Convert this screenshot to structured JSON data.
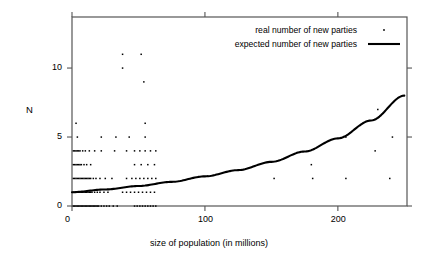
{
  "chart_data": {
    "type": "scatter",
    "title": "",
    "subtitle": "",
    "xlabel": "size of population  (in millions)",
    "ylabel": "N",
    "xlim": [
      0,
      252
    ],
    "ylim": [
      0,
      13.7
    ],
    "xticks": [
      0,
      100,
      200
    ],
    "xtick_labels": [
      "0",
      "100",
      "200"
    ],
    "yticks": [
      0,
      5,
      10
    ],
    "ytick_labels": [
      "0",
      "5",
      "10"
    ],
    "grid": false,
    "legend_position": "top-right",
    "frame": "box",
    "series": [
      {
        "name": "real number of new parties",
        "type": "scatter",
        "marker": "dot",
        "color": "#000000",
        "points": [
          [
            1,
            0
          ],
          [
            2,
            0
          ],
          [
            3,
            0
          ],
          [
            4,
            0
          ],
          [
            5,
            0
          ],
          [
            6,
            0
          ],
          [
            7,
            0
          ],
          [
            8,
            0
          ],
          [
            9,
            0
          ],
          [
            10,
            0
          ],
          [
            11,
            0
          ],
          [
            12,
            0
          ],
          [
            13,
            0
          ],
          [
            14,
            0
          ],
          [
            15,
            0
          ],
          [
            16,
            0
          ],
          [
            17,
            0
          ],
          [
            18,
            0
          ],
          [
            19,
            0
          ],
          [
            20,
            0
          ],
          [
            22,
            0
          ],
          [
            24,
            0
          ],
          [
            26,
            0
          ],
          [
            28,
            0
          ],
          [
            31,
            0
          ],
          [
            34,
            0
          ],
          [
            47,
            0
          ],
          [
            49,
            0
          ],
          [
            51,
            0
          ],
          [
            53,
            0
          ],
          [
            55,
            0
          ],
          [
            57,
            0
          ],
          [
            59,
            0
          ],
          [
            61,
            0
          ],
          [
            63,
            0
          ],
          [
            1,
            1
          ],
          [
            2,
            1
          ],
          [
            3,
            1
          ],
          [
            4,
            1
          ],
          [
            5,
            1
          ],
          [
            6,
            1
          ],
          [
            7,
            1
          ],
          [
            8,
            1
          ],
          [
            9,
            1
          ],
          [
            10,
            1
          ],
          [
            11,
            1
          ],
          [
            12,
            1
          ],
          [
            13,
            1
          ],
          [
            14,
            1
          ],
          [
            15,
            1
          ],
          [
            17,
            1
          ],
          [
            19,
            1
          ],
          [
            21,
            1
          ],
          [
            24,
            1
          ],
          [
            27,
            1
          ],
          [
            38,
            1
          ],
          [
            41,
            1
          ],
          [
            44,
            1
          ],
          [
            47,
            1
          ],
          [
            50,
            1
          ],
          [
            53,
            1
          ],
          [
            56,
            1
          ],
          [
            59,
            1
          ],
          [
            62,
            1
          ],
          [
            1,
            2
          ],
          [
            2,
            2
          ],
          [
            3,
            2
          ],
          [
            4,
            2
          ],
          [
            5,
            2
          ],
          [
            6,
            2
          ],
          [
            7,
            2
          ],
          [
            8,
            2
          ],
          [
            9,
            2
          ],
          [
            10,
            2
          ],
          [
            11,
            2
          ],
          [
            12,
            2
          ],
          [
            13,
            2
          ],
          [
            14,
            2
          ],
          [
            16,
            2
          ],
          [
            18,
            2
          ],
          [
            21,
            2
          ],
          [
            25,
            2
          ],
          [
            30,
            2
          ],
          [
            41,
            2
          ],
          [
            45,
            2
          ],
          [
            48,
            2
          ],
          [
            51,
            2
          ],
          [
            54,
            2
          ],
          [
            57,
            2
          ],
          [
            60,
            2
          ],
          [
            63,
            2
          ],
          [
            152,
            2
          ],
          [
            181,
            2
          ],
          [
            206,
            2
          ],
          [
            239,
            2
          ],
          [
            1,
            3
          ],
          [
            2,
            3
          ],
          [
            3,
            3
          ],
          [
            4,
            3
          ],
          [
            5,
            3
          ],
          [
            6,
            3
          ],
          [
            7,
            3
          ],
          [
            9,
            3
          ],
          [
            11,
            3
          ],
          [
            14,
            3
          ],
          [
            47,
            3
          ],
          [
            52,
            3
          ],
          [
            57,
            3
          ],
          [
            62,
            3
          ],
          [
            180,
            3
          ],
          [
            1,
            4
          ],
          [
            2,
            4
          ],
          [
            3,
            4
          ],
          [
            4,
            4
          ],
          [
            5,
            4
          ],
          [
            6,
            4
          ],
          [
            8,
            4
          ],
          [
            10,
            4
          ],
          [
            13,
            4
          ],
          [
            17,
            4
          ],
          [
            22,
            4
          ],
          [
            32,
            4
          ],
          [
            41,
            4
          ],
          [
            47,
            4
          ],
          [
            51,
            4
          ],
          [
            55,
            4
          ],
          [
            59,
            4
          ],
          [
            63,
            4
          ],
          [
            228,
            4
          ],
          [
            4,
            5
          ],
          [
            22,
            5
          ],
          [
            33,
            5
          ],
          [
            43,
            5
          ],
          [
            55,
            5
          ],
          [
            206,
            5
          ],
          [
            241,
            5
          ],
          [
            3,
            6
          ],
          [
            55,
            6
          ],
          [
            230,
            7
          ],
          [
            54,
            9
          ],
          [
            38,
            10
          ],
          [
            38,
            11
          ],
          [
            52,
            11
          ]
        ]
      },
      {
        "name": "expected number of new parties",
        "type": "line",
        "color": "#000000",
        "x": [
          0,
          25,
          50,
          75,
          100,
          125,
          150,
          175,
          200,
          225,
          250
        ],
        "y": [
          1.0,
          1.2,
          1.45,
          1.75,
          2.15,
          2.6,
          3.2,
          3.95,
          4.9,
          6.2,
          8.0
        ]
      }
    ]
  },
  "legend": {
    "items": [
      {
        "label": "real number of new parties",
        "marker": "dot"
      },
      {
        "label": "expected number of new parties",
        "marker": "line"
      }
    ]
  },
  "colors": {
    "axis": "#555555",
    "data": "#000000",
    "background": "#ffffff"
  }
}
